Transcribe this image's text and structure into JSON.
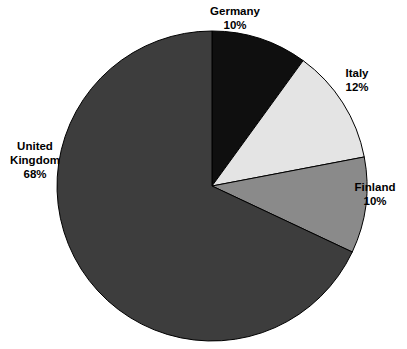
{
  "chart_data": {
    "type": "pie",
    "title": "",
    "subtitle": "",
    "xlabel": "",
    "ylabel": "",
    "legend_position": "none",
    "grid": false,
    "labels_outside": true,
    "start_angle_deg": 0,
    "direction": "clockwise",
    "center": {
      "x": 212,
      "y": 186
    },
    "radius": 155,
    "categories": [
      "Germany",
      "Italy",
      "Finland",
      "United Kingdom"
    ],
    "values": [
      10,
      12,
      10,
      68
    ],
    "unit": "%",
    "colors": [
      "#0f0f0f",
      "#e4e4e4",
      "#8a8a8a",
      "#3d3d3d"
    ],
    "stroke_color": "#000000",
    "slices": [
      {
        "name": "Germany",
        "value": 10,
        "value_text": "10%",
        "color": "#0f0f0f",
        "label_lines": [
          "Germany",
          "10%"
        ]
      },
      {
        "name": "Italy",
        "value": 12,
        "value_text": "12%",
        "color": "#e4e4e4",
        "label_lines": [
          "Italy",
          "12%"
        ]
      },
      {
        "name": "Finland",
        "value": 10,
        "value_text": "10%",
        "color": "#8a8a8a",
        "label_lines": [
          "Finland",
          "10%"
        ]
      },
      {
        "name": "United Kingdom",
        "value": 68,
        "value_text": "68%",
        "color": "#3d3d3d",
        "label_lines": [
          "United",
          "Kingdom",
          "68%"
        ]
      }
    ]
  },
  "labels": {
    "germany": "Germany\n10%",
    "italy": "Italy\n12%",
    "finland": "Finland\n10%",
    "united_kingdom": "United\nKingdom\n68%"
  }
}
